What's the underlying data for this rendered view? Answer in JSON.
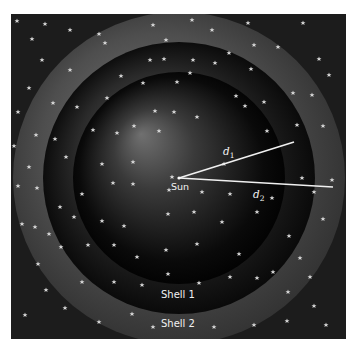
{
  "figure": {
    "background_color": "#1a1a1a",
    "sun": {
      "label": "Sun",
      "x": 168,
      "y": 164
    },
    "shells": [
      {
        "name": "Shell 2",
        "label": "Shell 2",
        "radius": 200,
        "color_light": "#5a5a5a",
        "color_dark": "#202020"
      },
      {
        "name": "Shell 1",
        "label": "Shell 1",
        "radius": 136,
        "color_light": "#4a4a4a",
        "color_dark": "#0c0c0c"
      },
      {
        "name": "inner-sphere",
        "radius": 106,
        "color_light": "#6a6a6a",
        "color_dark": "#000000"
      }
    ],
    "distances": [
      {
        "label": "d",
        "subscript": "1",
        "x2": 283,
        "y2": 128
      },
      {
        "label": "d",
        "subscript": "2",
        "x2": 322,
        "y2": 173
      }
    ],
    "labels": {
      "sun": "Sun",
      "shell1": "Shell 1",
      "shell2": "Shell 2",
      "d1_main": "d",
      "d1_sub": "1",
      "d2_main": "d",
      "d2_sub": "2"
    }
  }
}
